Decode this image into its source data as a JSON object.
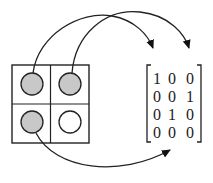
{
  "diagram": {
    "grid": {
      "rows": 2,
      "cols": 2,
      "cells": [
        {
          "row": 0,
          "col": 0,
          "state": "filled"
        },
        {
          "row": 0,
          "col": 1,
          "state": "filled"
        },
        {
          "row": 1,
          "col": 0,
          "state": "filled"
        },
        {
          "row": 1,
          "col": 1,
          "state": "empty"
        }
      ],
      "filled_color": "#c8c8c8",
      "empty_color": "#ffffff"
    },
    "matrix": {
      "rows": [
        [
          "1",
          "0",
          "0"
        ],
        [
          "0",
          "0",
          "1"
        ],
        [
          "0",
          "1",
          "0"
        ],
        [
          "0",
          "0",
          "0"
        ]
      ]
    },
    "arrows": [
      {
        "from": "cell-0-0",
        "to": "matrix-column-1"
      },
      {
        "from": "cell-0-1",
        "to": "matrix-column-3"
      },
      {
        "from": "cell-1-0",
        "to": "matrix-column-2"
      }
    ]
  }
}
